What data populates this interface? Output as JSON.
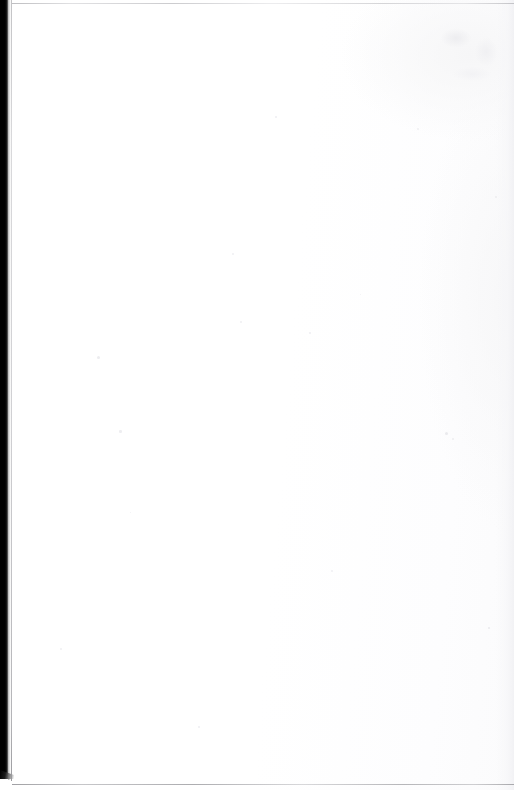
{
  "page": {
    "kind": "scanned-blank-page",
    "text_content": "",
    "width_px": 514,
    "height_px": 790,
    "paper_color": "#fefefe",
    "background_color": "#ffffff"
  },
  "artifacts": {
    "gutter_band": {
      "name": "binding-gutter-shadow",
      "color": "#000000",
      "x_px": 0,
      "y_px": 0,
      "width_px": 8,
      "height_px": 777
    },
    "page_edge_rule": {
      "name": "page-edge-line",
      "color": "#bcbcc0",
      "x_px": 11,
      "width_px": 1,
      "height_px": 781
    },
    "top_rule": {
      "name": "top-horizontal-rule",
      "color": "#b4b4b8",
      "y_px": 3,
      "width_px": 502,
      "height_px": 1
    },
    "bottom_rule": {
      "name": "bottom-horizontal-rule",
      "color": "#9c9ca0",
      "y_px": 784,
      "width_px": 502,
      "height_px": 1
    },
    "upper_right_smudge": {
      "name": "scan-smudge",
      "color": "#ebebee",
      "x_px": 438,
      "y_px": 26,
      "width_px": 72,
      "height_px": 58
    },
    "right_margin_shade": {
      "name": "right-margin-shading",
      "color": "#f0f0f3",
      "width_px": 18
    }
  },
  "specks": [
    {
      "x": 97,
      "y": 356,
      "size": 3,
      "color": "#ececef"
    },
    {
      "x": 119,
      "y": 430,
      "size": 2.5,
      "color": "#eeeef1"
    },
    {
      "x": 240,
      "y": 321,
      "size": 2,
      "color": "#efeff2"
    },
    {
      "x": 232,
      "y": 253,
      "size": 1.8,
      "color": "#f0f0f3"
    },
    {
      "x": 309,
      "y": 332,
      "size": 1.6,
      "color": "#f0f0f3"
    },
    {
      "x": 445,
      "y": 432,
      "size": 3.2,
      "color": "#eaeaed"
    },
    {
      "x": 452,
      "y": 438,
      "size": 1.8,
      "color": "#ededf0"
    },
    {
      "x": 331,
      "y": 570,
      "size": 1.6,
      "color": "#f1f1f4"
    },
    {
      "x": 275,
      "y": 116,
      "size": 1.6,
      "color": "#f0f0f3"
    },
    {
      "x": 417,
      "y": 128,
      "size": 1.5,
      "color": "#f1f1f4"
    },
    {
      "x": 198,
      "y": 726,
      "size": 1.6,
      "color": "#f0f0f3"
    },
    {
      "x": 130,
      "y": 512,
      "size": 1.4,
      "color": "#f1f1f4"
    },
    {
      "x": 495,
      "y": 196,
      "size": 1.8,
      "color": "#ededf0"
    },
    {
      "x": 488,
      "y": 627,
      "size": 2.2,
      "color": "#eaeaed"
    },
    {
      "x": 360,
      "y": 294,
      "size": 1.4,
      "color": "#f1f1f4"
    },
    {
      "x": 60,
      "y": 648,
      "size": 1.5,
      "color": "#f1f1f4"
    }
  ]
}
